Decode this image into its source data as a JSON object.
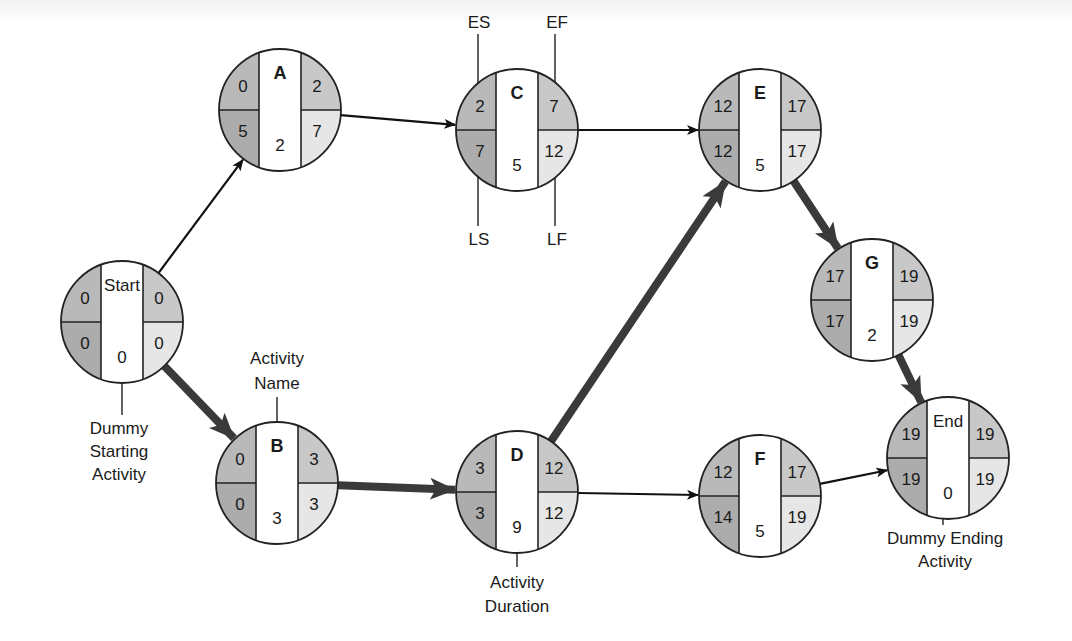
{
  "colors": {
    "es_ls_fill": "#b9b9b9",
    "ef_fill": "#c8c8c8",
    "lf_fill": "#e6e6e6",
    "center_fill": "#ffffff",
    "stroke": "#222222",
    "critical_arrow": "#3a3a3a",
    "normal_arrow": "#111111"
  },
  "nodes": [
    {
      "id": "start",
      "name": "Start",
      "es": "0",
      "ef": "0",
      "ls": "0",
      "lf": "0",
      "duration": "0",
      "dummy": true,
      "cx": 122,
      "cy": 322
    },
    {
      "id": "a",
      "name": "A",
      "es": "0",
      "ef": "2",
      "ls": "5",
      "lf": "7",
      "duration": "2",
      "dummy": false,
      "cx": 280,
      "cy": 110
    },
    {
      "id": "b",
      "name": "B",
      "es": "0",
      "ef": "3",
      "ls": "0",
      "lf": "3",
      "duration": "3",
      "dummy": false,
      "cx": 277,
      "cy": 483
    },
    {
      "id": "c",
      "name": "C",
      "es": "2",
      "ef": "7",
      "ls": "7",
      "lf": "12",
      "duration": "5",
      "dummy": false,
      "cx": 517,
      "cy": 130
    },
    {
      "id": "d",
      "name": "D",
      "es": "3",
      "ef": "12",
      "ls": "3",
      "lf": "12",
      "duration": "9",
      "dummy": false,
      "cx": 517,
      "cy": 492
    },
    {
      "id": "e",
      "name": "E",
      "es": "12",
      "ef": "17",
      "ls": "12",
      "lf": "17",
      "duration": "5",
      "dummy": false,
      "cx": 760,
      "cy": 130
    },
    {
      "id": "f",
      "name": "F",
      "es": "12",
      "ef": "17",
      "ls": "14",
      "lf": "19",
      "duration": "5",
      "dummy": false,
      "cx": 760,
      "cy": 496
    },
    {
      "id": "g",
      "name": "G",
      "es": "17",
      "ef": "19",
      "ls": "17",
      "lf": "19",
      "duration": "2",
      "dummy": false,
      "cx": 872,
      "cy": 300
    },
    {
      "id": "end",
      "name": "End",
      "es": "19",
      "ef": "19",
      "ls": "19",
      "lf": "19",
      "duration": "0",
      "dummy": true,
      "cx": 948,
      "cy": 458
    }
  ],
  "edges": [
    {
      "from": "start",
      "to": "a",
      "critical": false
    },
    {
      "from": "start",
      "to": "b",
      "critical": true
    },
    {
      "from": "a",
      "to": "c",
      "critical": false
    },
    {
      "from": "b",
      "to": "d",
      "critical": true
    },
    {
      "from": "c",
      "to": "e",
      "critical": false
    },
    {
      "from": "d",
      "to": "e",
      "critical": true
    },
    {
      "from": "d",
      "to": "f",
      "critical": false
    },
    {
      "from": "e",
      "to": "g",
      "critical": true
    },
    {
      "from": "g",
      "to": "end",
      "critical": true
    },
    {
      "from": "f",
      "to": "end",
      "critical": false
    }
  ],
  "annotations": {
    "es": "ES",
    "ef": "EF",
    "ls": "LS",
    "lf": "LF",
    "activity_name": [
      "Activity",
      "Name"
    ],
    "activity_duration": [
      "Activity",
      "Duration"
    ],
    "dummy_start": [
      "Dummy",
      "Starting",
      "Activity"
    ],
    "dummy_end": [
      "Dummy Ending",
      "Activity"
    ]
  }
}
